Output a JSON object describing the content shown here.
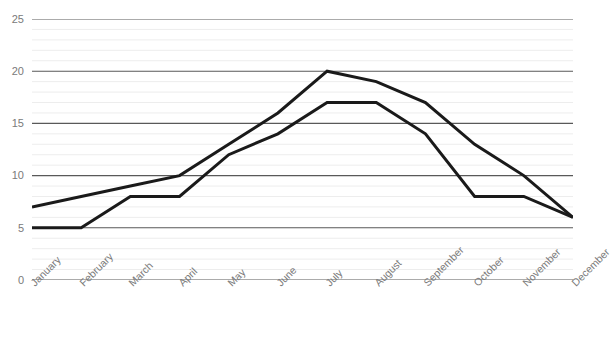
{
  "chart_data": {
    "type": "line",
    "title": "",
    "xlabel": "",
    "ylabel": "",
    "ylim": [
      0,
      25
    ],
    "y_ticks": [
      0,
      5,
      10,
      15,
      20,
      25
    ],
    "grid": "horizontal major and minor",
    "minor_gridline_step": 1,
    "legend": "none",
    "categories": [
      "January",
      "February",
      "March",
      "April",
      "May",
      "June",
      "July",
      "August",
      "September",
      "October",
      "November",
      "December"
    ],
    "series": [
      {
        "name": "Series 1",
        "color": "#1a1a1a",
        "values": [
          7,
          8,
          9,
          10,
          13,
          16,
          20,
          19,
          17,
          13,
          10,
          6
        ]
      },
      {
        "name": "Series 2",
        "color": "#1a1a1a",
        "values": [
          5,
          5,
          8,
          8,
          12,
          14,
          17,
          17,
          14,
          8,
          8,
          6
        ]
      }
    ]
  },
  "axes": {
    "y_tick_labels": [
      "25",
      "20",
      "15",
      "10",
      "5",
      "0"
    ],
    "x_tick_labels": [
      "January",
      "February",
      "March",
      "April",
      "May",
      "June",
      "July",
      "August",
      "September",
      "October",
      "November",
      "December"
    ]
  },
  "title_strip": {
    "text": ""
  },
  "colors": {
    "line": "#1a1a1a",
    "major_gridline": "#595959",
    "minor_gridline": "#ededed",
    "tick_label": "#7a7a7a",
    "background": "#ffffff"
  }
}
